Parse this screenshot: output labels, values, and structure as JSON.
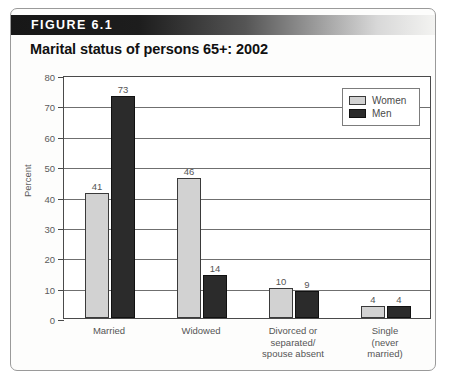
{
  "figure": {
    "label": "FIGURE 6.1",
    "title": "Marital status of persons 65+: 2002"
  },
  "legend": {
    "women_label": "Women",
    "men_label": "Men"
  },
  "colors": {
    "women": "#d2d2d2",
    "men": "#2b2b2b",
    "frame": "#9a9a9a",
    "axis": "#4a4a4a",
    "grid": "#6f6f6f",
    "text": "#555555"
  },
  "chart_data": {
    "type": "bar",
    "title": "Marital status of persons 65+: 2002",
    "xlabel": "",
    "ylabel": "Percent",
    "ylim": [
      0,
      80
    ],
    "yticks": [
      0,
      10,
      20,
      30,
      40,
      50,
      60,
      70,
      80
    ],
    "grid": true,
    "legend_position": "upper-right-inside",
    "categories": [
      "Married",
      "Widowed",
      "Divorced or\nseparated/\nspouse absent",
      "Single\n(never\nmarried)"
    ],
    "category_lines": [
      [
        "Married"
      ],
      [
        "Widowed"
      ],
      [
        "Divorced or",
        "separated/",
        "spouse absent"
      ],
      [
        "Single",
        "(never",
        "married)"
      ]
    ],
    "series": [
      {
        "name": "Women",
        "values": [
          41,
          46,
          10,
          4
        ]
      },
      {
        "name": "Men",
        "values": [
          73,
          14,
          9,
          4
        ]
      }
    ]
  }
}
